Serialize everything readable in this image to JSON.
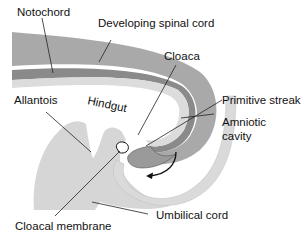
{
  "diagram": {
    "type": "anatomical-illustration",
    "labels": {
      "notochord": "Notochord",
      "developing_spinal_cord": "Developing spinal cord",
      "cloaca": "Cloaca",
      "allantois": "Allantois",
      "hindgut": "Hindgut",
      "primitive_streak": "Primitive streak",
      "amniotic_cavity_line1": "Amniotic",
      "amniotic_cavity_line2": "cavity",
      "cloacal_membrane": "Cloacal membrane",
      "umbilical_cord": "Umbilical cord"
    },
    "colors": {
      "spinal_cord_tissue": "#a9a9a9",
      "notochord_band": "#8a8a8a",
      "endoderm_band": "#dcdcdc",
      "mesoderm_body": "#d6d6d6",
      "amnion_wall": "#dadada",
      "outline": "#333333",
      "background": "#ffffff"
    }
  }
}
